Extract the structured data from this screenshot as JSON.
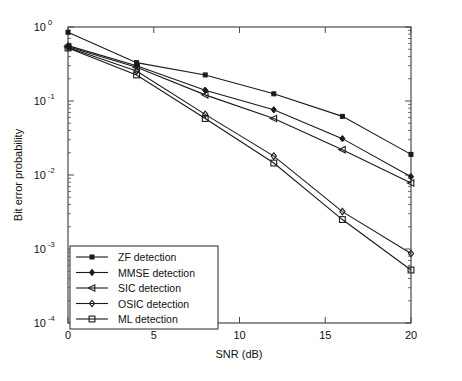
{
  "chart_data": {
    "type": "line",
    "title": "",
    "xlabel": "SNR (dB)",
    "ylabel": "Bit error probability",
    "x": [
      0,
      4,
      8,
      12,
      16,
      20
    ],
    "xlim": [
      0,
      20
    ],
    "ylim": [
      0.0001,
      1
    ],
    "yscale": "log",
    "grid": false,
    "legend_position": "lower-left",
    "xticks": [
      "0",
      "5",
      "10",
      "15",
      "20"
    ],
    "xtick_values": [
      0,
      5,
      10,
      15,
      20
    ],
    "yticks": [
      "10^0",
      "10^-1",
      "10^-2",
      "10^-3",
      "10^-4"
    ],
    "ytick_values": [
      1,
      0.1,
      0.01,
      0.001,
      0.0001
    ],
    "ytick_mantissa": "10",
    "ytick_exponents": [
      "0",
      "-1",
      "-2",
      "-3",
      "-4"
    ],
    "series": [
      {
        "name": "ZF detection",
        "marker": "plus-square",
        "values": [
          0.85,
          0.33,
          0.225,
          0.125,
          0.062,
          0.019
        ]
      },
      {
        "name": "MMSE detection",
        "marker": "diamond-filled",
        "values": [
          0.56,
          0.3,
          0.14,
          0.076,
          0.031,
          0.0095
        ]
      },
      {
        "name": "SIC detection",
        "marker": "triangle-left",
        "values": [
          0.54,
          0.285,
          0.121,
          0.058,
          0.022,
          0.0078
        ]
      },
      {
        "name": "OSIC detection",
        "marker": "diamond-open",
        "values": [
          0.53,
          0.255,
          0.066,
          0.018,
          0.0032,
          0.00087
        ]
      },
      {
        "name": "ML detection",
        "marker": "square-open",
        "values": [
          0.52,
          0.225,
          0.058,
          0.0145,
          0.0025,
          0.00052
        ]
      }
    ]
  },
  "legend": {
    "entries": [
      {
        "label": "ZF detection"
      },
      {
        "label": "MMSE detection"
      },
      {
        "label": "SIC detection"
      },
      {
        "label": "OSIC detection"
      },
      {
        "label": "ML detection"
      }
    ]
  },
  "axes": {
    "x_title": "SNR (dB)",
    "y_title": "Bit error probability",
    "xtick_labels": [
      "0",
      "5",
      "10",
      "15",
      "20"
    ],
    "ytick_base": "10",
    "ytick_exps": [
      "0",
      "-1",
      "-2",
      "-3",
      "-4"
    ]
  }
}
